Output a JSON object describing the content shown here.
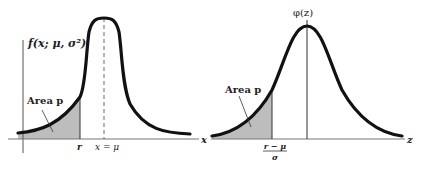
{
  "left_panel": {
    "y_axis_label": "f(x; μ, σ²)",
    "x_axis_label": "x",
    "area_label": "Area p",
    "cutoff_label": "r",
    "mean_label": "x = μ"
  },
  "right_panel": {
    "y_axis_label": "φ(z)",
    "x_axis_label": "z",
    "area_label": "Area p",
    "cutoff_numerator": "r − μ",
    "cutoff_denominator": "σ"
  },
  "colors": {
    "curve": "#111111",
    "shade": "#bdbdbd",
    "axis": "#555555",
    "background": "#ffffff"
  }
}
